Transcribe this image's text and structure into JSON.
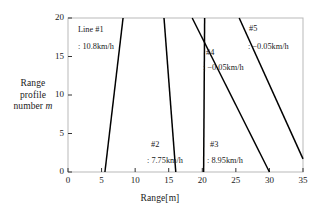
{
  "chart_data": {
    "type": "line",
    "title": "",
    "xlabel": "Range[m]",
    "ylabel_lines": [
      "Range",
      "profile",
      "number "
    ],
    "ylabel_italic": "m",
    "xlim": [
      0,
      35
    ],
    "ylim": [
      0,
      20
    ],
    "xticks": [
      0,
      5,
      10,
      15,
      20,
      25,
      30,
      35
    ],
    "yticks": [
      0,
      5,
      10,
      15,
      20
    ],
    "grid": false,
    "legend": "none",
    "series": [
      {
        "name": "Line #1",
        "label_title": "Line #1",
        "label_value": ": 10.8km/h",
        "velocity_kmh": 10.8,
        "points": [
          [
            5.5,
            0
          ],
          [
            8.2,
            20
          ]
        ]
      },
      {
        "name": "#2",
        "label_title": "#2",
        "label_value": ": 7.75km/h",
        "velocity_kmh": 7.75,
        "points": [
          [
            14.3,
            20
          ],
          [
            16.05,
            0
          ]
        ]
      },
      {
        "name": "#3",
        "label_title": "#3",
        "label_value": ": 8.95km/h",
        "velocity_kmh": 8.95,
        "points": [
          [
            20.35,
            20
          ],
          [
            20.2,
            0
          ]
        ]
      },
      {
        "name": "#4",
        "label_title": "#4",
        "label_value": ": −0.05km/h",
        "velocity_kmh": -0.05,
        "points": [
          [
            18.5,
            20
          ],
          [
            30.0,
            0
          ]
        ]
      },
      {
        "name": "#5",
        "label_title": "#5",
        "label_value": ": −0.05km/h",
        "velocity_kmh": -0.05,
        "points": [
          [
            25.5,
            20
          ],
          [
            35.0,
            1.7
          ]
        ]
      }
    ],
    "annotations": [
      {
        "name": "line1-title",
        "text": "Line #1"
      },
      {
        "name": "line1-value",
        "text": ": 10.8km/h"
      },
      {
        "name": "line2-title",
        "text": "#2"
      },
      {
        "name": "line2-value",
        "text": ": 7.75km/h"
      },
      {
        "name": "line3-title",
        "text": "#3"
      },
      {
        "name": "line3-value",
        "text": ": 8.95km/h"
      },
      {
        "name": "line4-title",
        "text": "#4"
      },
      {
        "name": "line4-value",
        "text": ": −0.05km/h"
      },
      {
        "name": "line5-title",
        "text": "#5"
      },
      {
        "name": "line5-value",
        "text": ": −0.05km/h"
      }
    ],
    "style": {
      "line_color": "#000000",
      "frame_color": "#b9b9b9",
      "background": "#ffffff"
    }
  },
  "xtick_labels": [
    "0",
    "5",
    "10",
    "15",
    "20",
    "25",
    "30",
    "35"
  ],
  "ytick_labels": [
    "0",
    "5",
    "10",
    "15",
    "20"
  ]
}
